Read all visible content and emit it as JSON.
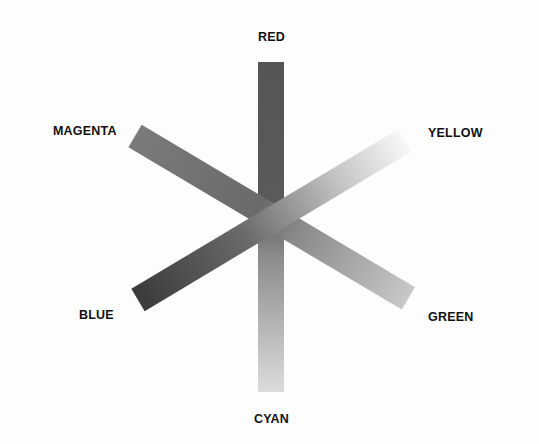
{
  "diagram": {
    "title": "",
    "labels": {
      "red": "RED",
      "magenta": "MAGENTA",
      "yellow": "YELLOW",
      "blue": "BLUE",
      "green": "GREEN",
      "cyan": "CYAN"
    },
    "bars": [
      {
        "name": "red-cyan",
        "from": "RED",
        "to": "CYAN",
        "from_color": "#555555",
        "to_color": "#dadada"
      },
      {
        "name": "magenta-green",
        "from": "MAGENTA",
        "to": "GREEN",
        "from_color": "#7a7a7a",
        "to_color": "#c6c6c6"
      },
      {
        "name": "blue-yellow",
        "from": "BLUE",
        "to": "YELLOW",
        "from_color": "#3a3a3a",
        "to_color": "#f7f7f7"
      }
    ]
  }
}
